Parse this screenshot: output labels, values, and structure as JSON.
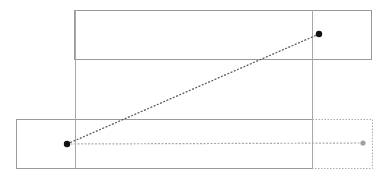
{
  "canvas": {
    "width": 386,
    "height": 176,
    "background": "#ffffff"
  },
  "colors": {
    "box_stroke": "#9a9a9a",
    "guide_stroke": "#a8a8a8",
    "connector": "#555555",
    "ghost": "#aaaaaa",
    "point": "#111111",
    "ghost_point": "#a0a0a0"
  },
  "boxes": [
    {
      "name": "top-box",
      "x": 74,
      "y": 10,
      "w": 297,
      "h": 49
    },
    {
      "name": "bottom-box",
      "x": 16,
      "y": 119,
      "w": 296,
      "h": 49
    }
  ],
  "ghost_box": {
    "x": 312,
    "y": 119,
    "w": 60,
    "h": 49
  },
  "guides": [
    {
      "name": "left-guide",
      "x": 75,
      "y1": 10,
      "y2": 168
    },
    {
      "name": "right-guide",
      "x": 312,
      "y1": 10,
      "y2": 168
    }
  ],
  "points": {
    "start": {
      "x": 67,
      "y": 144
    },
    "end": {
      "x": 319,
      "y": 34
    },
    "ghost_end": {
      "x": 363,
      "y": 143
    }
  }
}
